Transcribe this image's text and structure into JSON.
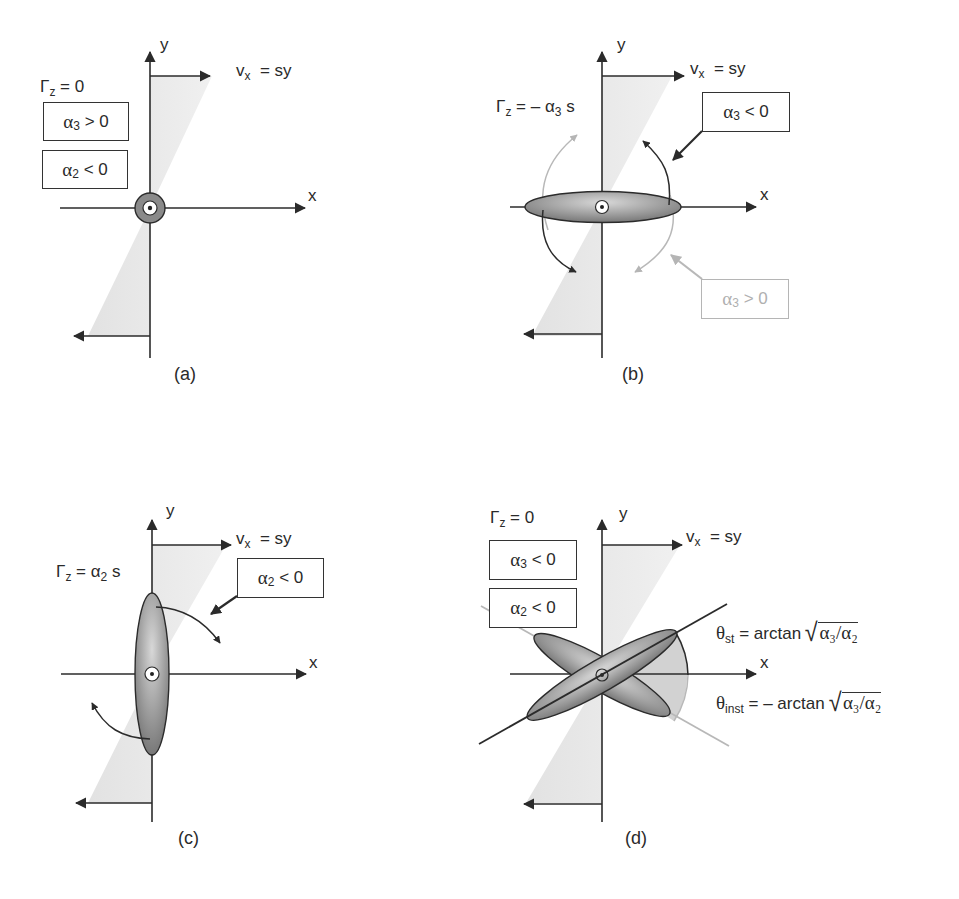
{
  "figure": {
    "common": {
      "x_axis_label": "x",
      "y_axis_label": "y",
      "velocity_label_main": "v",
      "velocity_label_sub": "x",
      "velocity_label_rhs": "= sy"
    },
    "panels": [
      {
        "id": "a",
        "caption": "(a)",
        "circulation_label": {
          "main": "Γ",
          "sub": "z",
          "rhs": "= 0"
        },
        "boxes": [
          {
            "greek": "α",
            "sub": "3",
            "rhs": "> 0"
          },
          {
            "greek": "α",
            "sub": "2",
            "rhs": "< 0"
          }
        ],
        "vortex_shape": "circle"
      },
      {
        "id": "b",
        "caption": "(b)",
        "circulation_label": {
          "main": "Γ",
          "sub": "z",
          "rhs": "= – α",
          "rhs_sub": "3",
          "rhs_tail": " s"
        },
        "boxes": [
          {
            "greek": "α",
            "sub": "3",
            "rhs": "< 0",
            "style": "dark"
          },
          {
            "greek": "α",
            "sub": "3",
            "rhs": "> 0",
            "style": "faint"
          }
        ],
        "vortex_shape": "horizontal ellipse"
      },
      {
        "id": "c",
        "caption": "(c)",
        "circulation_label": {
          "main": "Γ",
          "sub": "z",
          "rhs": "= α",
          "rhs_sub": "2",
          "rhs_tail": " s"
        },
        "boxes": [
          {
            "greek": "α",
            "sub": "2",
            "rhs": " < 0"
          }
        ],
        "vortex_shape": "vertical ellipse"
      },
      {
        "id": "d",
        "caption": "(d)",
        "circulation_label": {
          "main": "Γ",
          "sub": "z",
          "rhs": "= 0"
        },
        "boxes": [
          {
            "greek": "α",
            "sub": "3",
            "rhs": "< 0"
          },
          {
            "greek": "α",
            "sub": "2",
            "rhs": "< 0"
          }
        ],
        "vortex_shape": "two tilted ellipses",
        "angle_labels": [
          {
            "theta": "θ",
            "sub": "st",
            "rhs": "= arctan",
            "radicand": "α₃/α₂"
          },
          {
            "theta": "θ",
            "sub": "inst",
            "rhs": "= – arctan",
            "radicand": "α₃/α₂"
          }
        ]
      }
    ],
    "colors": {
      "line": "#2b2b2b",
      "shear_fill": "#e6e6e6",
      "vortex_fill": "#8a8a8a",
      "faint": "#b8b8b8"
    }
  }
}
